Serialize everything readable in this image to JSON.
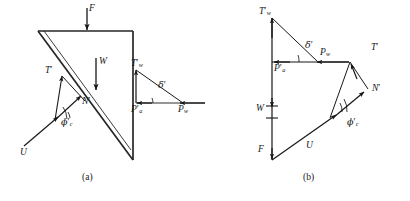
{
  "figure": {
    "type": "engineering-free-body-and-force-polygon",
    "panels": [
      {
        "id": "a",
        "caption": "(a)",
        "description": "Free body diagram of failure wedge behind retaining wall"
      },
      {
        "id": "b",
        "caption": "(b)",
        "description": "Force polygon of equilibrium"
      }
    ],
    "colors": {
      "ink": "#171717",
      "background": "#ffffff",
      "line": "#262626"
    }
  },
  "labels": {
    "F": "F",
    "W": "W",
    "U": "U",
    "T_prime": "T",
    "N_prime": "N",
    "Tw_prime": "T",
    "Tw_sub": "w",
    "Pa_prime": "P",
    "Pa_sub": "a",
    "Pw": "P",
    "Pw_sub": "w",
    "phi_c_prime": "ϕ",
    "phi_sub": "c",
    "delta_prime": "δ",
    "prime": "′"
  },
  "panel_a": {
    "name": "free-body-diagram",
    "forces": [
      {
        "name": "F",
        "label": "F",
        "direction": "down",
        "applied_at": "top surface of wedge"
      },
      {
        "name": "W",
        "label": "W",
        "direction": "down",
        "applied_at": "wedge centroid"
      },
      {
        "name": "T-prime",
        "label": "T′",
        "direction": "up-left along failure plane"
      },
      {
        "name": "N-prime",
        "label": "N′",
        "direction": "up-right normal to failure plane"
      },
      {
        "name": "U",
        "label": "U",
        "direction": "up-right along failure plane"
      },
      {
        "name": "Tw-prime",
        "label": "T′w",
        "direction": "up along wall"
      },
      {
        "name": "Pa-prime",
        "label": "P′a",
        "direction": "left horizontal"
      },
      {
        "name": "Pw",
        "label": "Pw",
        "direction": "left horizontal"
      }
    ],
    "angles": [
      {
        "name": "phi-c-prime",
        "label": "ϕ′c",
        "between": "U and N′"
      },
      {
        "name": "delta-prime",
        "label": "δ′",
        "between": "P′a and resultant"
      }
    ]
  },
  "panel_b": {
    "name": "force-polygon",
    "vectors": [
      "T′w",
      "P′a",
      "Pw",
      "T′",
      "N′",
      "W",
      "F",
      "U"
    ],
    "angles": [
      {
        "name": "delta-prime",
        "label": "δ′"
      },
      {
        "name": "phi-c-prime",
        "label": "ϕ′c"
      }
    ]
  }
}
